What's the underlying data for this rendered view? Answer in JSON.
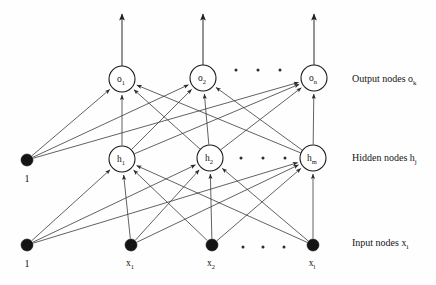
{
  "figure": {
    "background_color": "#fefefe",
    "ink_color": "#1a1a1a",
    "width": 436,
    "height": 285
  },
  "layer_captions": {
    "output": {
      "text": "Output nodes o",
      "sub": "k",
      "x": 352,
      "y": 82
    },
    "hidden": {
      "text": "Hidden nodes h",
      "sub": "j",
      "x": 352,
      "y": 161
    },
    "input": {
      "text": "Input nodes x",
      "sub": "i",
      "x": 352,
      "y": 246
    }
  },
  "layers": {
    "output": {
      "name": "output-layer",
      "radius": 13,
      "y": 78,
      "nodes": [
        {
          "id": "o1",
          "base": "o",
          "sub": "1",
          "cx": 122,
          "cy": 79
        },
        {
          "id": "o2",
          "base": "o",
          "sub": "2",
          "cx": 203,
          "cy": 78
        },
        {
          "id": "on",
          "base": "o",
          "sub": "n",
          "cx": 314,
          "cy": 78
        }
      ],
      "ellipsis": [
        {
          "cx": 236,
          "cy": 70
        },
        {
          "cx": 258,
          "cy": 70
        },
        {
          "cx": 280,
          "cy": 70
        }
      ],
      "out_arrows": [
        {
          "x": 122,
          "y_from": 66,
          "y_to": 14
        },
        {
          "x": 203,
          "y_from": 65,
          "y_to": 14
        },
        {
          "x": 314,
          "y_from": 65,
          "y_to": 14
        }
      ]
    },
    "hidden": {
      "name": "hidden-layer",
      "radius": 13,
      "y": 158,
      "nodes": [
        {
          "id": "h1",
          "base": "h",
          "sub": "1",
          "cx": 122,
          "cy": 159
        },
        {
          "id": "h2",
          "base": "h",
          "sub": "2",
          "cx": 210,
          "cy": 158
        },
        {
          "id": "hm",
          "base": "h",
          "sub": "m",
          "cx": 313,
          "cy": 158
        }
      ],
      "ellipsis": [
        {
          "cx": 241,
          "cy": 158
        },
        {
          "cx": 263,
          "cy": 158
        },
        {
          "cx": 285,
          "cy": 158
        }
      ]
    },
    "input": {
      "name": "input-layer",
      "radius": 6,
      "y": 245,
      "nodes": [
        {
          "id": "x1",
          "base": "x",
          "sub": "1",
          "cx": 131,
          "cy": 245,
          "label_y": 266
        },
        {
          "id": "x2",
          "base": "x",
          "sub": "2",
          "cx": 212,
          "cy": 245,
          "label_y": 266
        },
        {
          "id": "xl",
          "base": "x",
          "sub": "l",
          "cx": 313,
          "cy": 245,
          "label_y": 266
        }
      ],
      "ellipsis": [
        {
          "cx": 243,
          "cy": 247
        },
        {
          "cx": 263,
          "cy": 247
        },
        {
          "cx": 284,
          "cy": 247
        }
      ]
    },
    "bias": {
      "name": "bias-nodes",
      "radius": 6,
      "nodes": [
        {
          "id": "bias-hidden",
          "label": "1",
          "cx": 27,
          "cy": 160,
          "label_y": 182
        },
        {
          "id": "bias-input",
          "label": "1",
          "cx": 27,
          "cy": 245,
          "label_y": 267
        }
      ]
    }
  },
  "edges": {
    "input_to_hidden": [
      {
        "from": "bias-input",
        "to": "h1"
      },
      {
        "from": "bias-input",
        "to": "h2"
      },
      {
        "from": "bias-input",
        "to": "hm"
      },
      {
        "from": "x1",
        "to": "h1"
      },
      {
        "from": "x1",
        "to": "h2"
      },
      {
        "from": "x1",
        "to": "hm"
      },
      {
        "from": "x2",
        "to": "h1"
      },
      {
        "from": "x2",
        "to": "h2"
      },
      {
        "from": "x2",
        "to": "hm"
      },
      {
        "from": "xl",
        "to": "h1"
      },
      {
        "from": "xl",
        "to": "h2"
      },
      {
        "from": "xl",
        "to": "hm"
      }
    ],
    "hidden_to_output": [
      {
        "from": "bias-hidden",
        "to": "o1"
      },
      {
        "from": "bias-hidden",
        "to": "o2"
      },
      {
        "from": "bias-hidden",
        "to": "on"
      },
      {
        "from": "h1",
        "to": "o1"
      },
      {
        "from": "h1",
        "to": "o2"
      },
      {
        "from": "h1",
        "to": "on"
      },
      {
        "from": "h2",
        "to": "o1"
      },
      {
        "from": "h2",
        "to": "o2"
      },
      {
        "from": "h2",
        "to": "on"
      },
      {
        "from": "hm",
        "to": "o1"
      },
      {
        "from": "hm",
        "to": "o2"
      },
      {
        "from": "hm",
        "to": "on"
      }
    ]
  }
}
